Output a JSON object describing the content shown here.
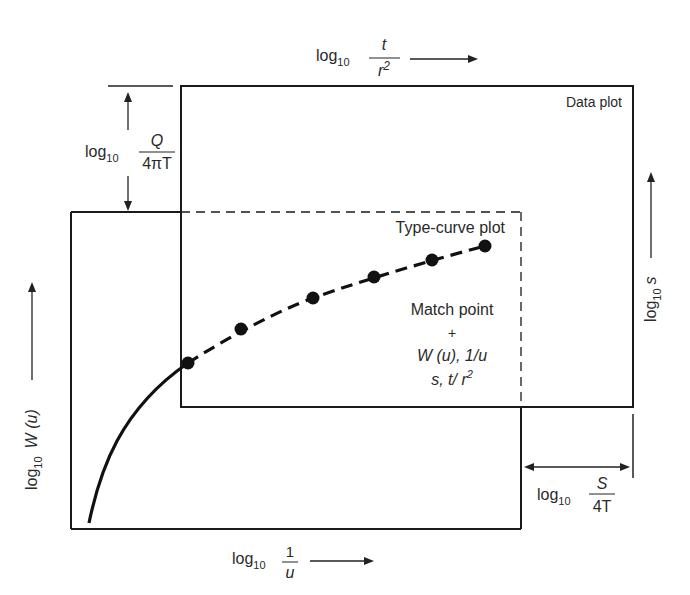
{
  "diagram": {
    "type": "type-curve matching (Theis method)",
    "colors": {
      "ink": "#1a1a1a",
      "text": "#2a2a2a",
      "background": "#ffffff"
    },
    "data_plot": {
      "title": "Data plot",
      "x_axis": {
        "prefix": "log",
        "sub": "10",
        "num": "t",
        "den": "r",
        "den_sup": "2"
      },
      "y_axis": {
        "prefix": "log",
        "sub": "10",
        "var": "s"
      }
    },
    "type_curve_plot": {
      "title": "Type-curve plot",
      "x_axis": {
        "prefix": "log",
        "sub": "10",
        "num": "1",
        "den": "u"
      },
      "y_axis": {
        "prefix": "log",
        "sub": "10",
        "var": "W (u)"
      }
    },
    "offsets": {
      "vertical": {
        "prefix": "log",
        "sub": "10",
        "num": "Q",
        "den": "4πT"
      },
      "horizontal": {
        "prefix": "log",
        "sub": "10",
        "num": "S",
        "den": "4T"
      }
    },
    "match_point": {
      "title": "Match point",
      "marker": "+",
      "line1": "W (u), 1/u",
      "line2_a": "s, t/ r",
      "line2_sup": "2"
    },
    "data_points": [
      [
        188,
        363
      ],
      [
        241,
        329
      ],
      [
        313,
        298
      ],
      [
        374,
        277
      ],
      [
        432,
        260
      ],
      [
        485,
        246
      ]
    ]
  }
}
